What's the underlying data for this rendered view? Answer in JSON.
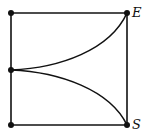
{
  "diagram": {
    "type": "graph",
    "stroke_color": "#111111",
    "background": "#ffffff",
    "nodes": [
      {
        "id": "top-left",
        "x": 11,
        "y": 13,
        "label": ""
      },
      {
        "id": "top-right",
        "x": 127,
        "y": 13,
        "label": "E"
      },
      {
        "id": "mid-left",
        "x": 11,
        "y": 70,
        "label": ""
      },
      {
        "id": "bottom-left",
        "x": 11,
        "y": 125,
        "label": ""
      },
      {
        "id": "bottom-right",
        "x": 127,
        "y": 125,
        "label": "S"
      }
    ],
    "edges": [
      {
        "from": "top-left",
        "to": "top-right",
        "shape": "straight"
      },
      {
        "from": "top-right",
        "to": "bottom-right",
        "shape": "straight"
      },
      {
        "from": "bottom-left",
        "to": "bottom-right",
        "shape": "straight"
      },
      {
        "from": "top-left",
        "to": "bottom-left",
        "shape": "straight"
      },
      {
        "from": "mid-left",
        "to": "top-right",
        "shape": "curve"
      },
      {
        "from": "mid-left",
        "to": "bottom-right",
        "shape": "curve"
      }
    ],
    "labels": {
      "E": "E",
      "S": "S"
    }
  }
}
